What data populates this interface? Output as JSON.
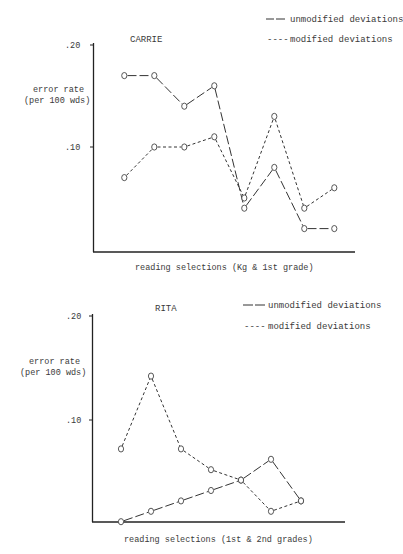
{
  "chart_data": [
    {
      "type": "line",
      "title": "CARRIE",
      "xlabel": "reading selections  (Kg & 1st grade)",
      "ylabel": [
        "error rate",
        "(per 100 wds)"
      ],
      "ylim": [
        0,
        0.2
      ],
      "yticks": [
        ".20",
        ".10"
      ],
      "ytick_values": [
        0.2,
        0.1
      ],
      "grid": false,
      "legend_position": "top-right",
      "x": [
        1,
        2,
        3,
        4,
        5,
        6,
        7,
        8
      ],
      "series": [
        {
          "name": "unmodified deviations",
          "style": "long-dash",
          "legend_glyph": "— —",
          "values": [
            0.17,
            0.17,
            0.14,
            0.16,
            0.04,
            0.08,
            0.02,
            0.02
          ]
        },
        {
          "name": "modified deviations",
          "style": "short-dash",
          "legend_glyph": "----",
          "values": [
            0.07,
            0.1,
            0.1,
            0.11,
            0.05,
            0.13,
            0.04,
            0.06
          ]
        }
      ]
    },
    {
      "type": "line",
      "title": "RITA",
      "xlabel": "reading selections  (1st & 2nd grades)",
      "ylabel": [
        "error rate",
        "(per 100 wds)"
      ],
      "ylim": [
        0,
        0.2
      ],
      "yticks": [
        ".20",
        ".10"
      ],
      "ytick_values": [
        0.2,
        0.1
      ],
      "grid": false,
      "legend_position": "top-right",
      "x": [
        1,
        2,
        3,
        4,
        5,
        6,
        7
      ],
      "series": [
        {
          "name": "unmodified deviations",
          "style": "long-dash",
          "legend_glyph": "— —",
          "values": [
            0.0,
            0.01,
            0.02,
            0.03,
            0.04,
            0.06,
            0.02
          ]
        },
        {
          "name": "modified deviations",
          "style": "short-dash",
          "legend_glyph": "----",
          "values": [
            0.07,
            0.14,
            0.07,
            0.05,
            0.04,
            0.01,
            0.02
          ]
        }
      ]
    }
  ]
}
